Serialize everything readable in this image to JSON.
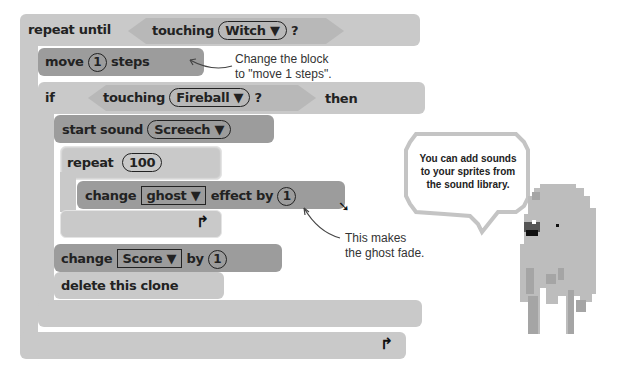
{
  "blocks": {
    "repeat_until": {
      "label": "repeat until",
      "cond_word": "touching",
      "target": "Witch",
      "q": "?"
    },
    "move": {
      "pre": "move",
      "value": "1",
      "post": "steps"
    },
    "if": {
      "label": "if",
      "cond_word": "touching",
      "target": "Fireball",
      "q": "?",
      "then": "then"
    },
    "start_sound": {
      "label": "start sound",
      "sound": "Screech"
    },
    "repeat": {
      "label": "repeat",
      "value": "100"
    },
    "change_effect": {
      "pre": "change",
      "effect": "ghost",
      "mid": "effect by",
      "value": "1"
    },
    "change_score": {
      "pre": "change",
      "var": "Score",
      "mid": "by",
      "value": "1"
    },
    "delete_clone": {
      "label": "delete this clone"
    },
    "dropdown_arrow": "▼",
    "loop_arrow": "↱"
  },
  "annotations": {
    "move_note_1": "Change the block",
    "move_note_2": "to \"move 1 steps\".",
    "fade_note_1": "This makes",
    "fade_note_2": "the ghost fade.",
    "bubble": "You can add sounds to your sprites from the sound library."
  }
}
